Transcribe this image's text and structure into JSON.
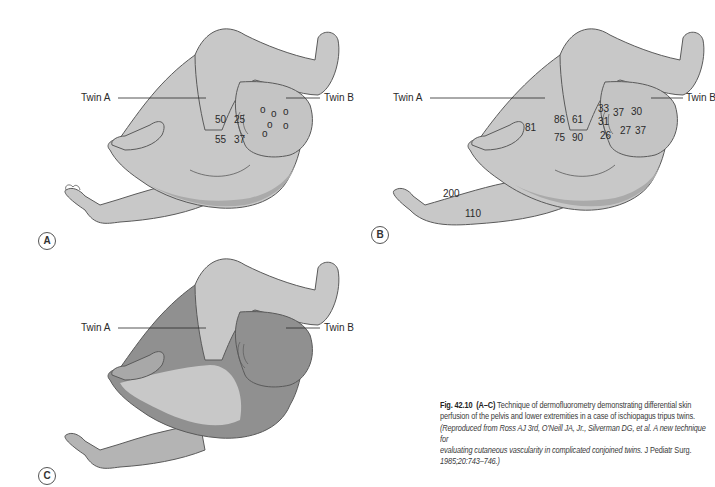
{
  "colors": {
    "body_light": "#c8c8c8",
    "body_mid": "#b4b4b4",
    "body_dark": "#8e8e8e",
    "outline": "#5a5a5a",
    "text": "#2a2a2a"
  },
  "panels": [
    {
      "badge": "A",
      "twin_a_label": "Twin A",
      "twin_b_label": "Twin B",
      "values_twin_a": [
        "50",
        "25",
        "55",
        "37"
      ],
      "twin_b_markers": [
        "o",
        "o",
        "o",
        "o",
        "o",
        "o"
      ]
    },
    {
      "badge": "B",
      "twin_a_label": "Twin A",
      "twin_b_label": "Twin B",
      "values_twin_a": [
        "81",
        "86",
        "61",
        "75",
        "90"
      ],
      "values_twin_b": [
        "33",
        "37",
        "30",
        "31",
        "26",
        "27",
        "37"
      ],
      "values_leg": [
        "200",
        "110"
      ]
    },
    {
      "badge": "C",
      "twin_a_label": "Twin A",
      "twin_b_label": "Twin B"
    }
  ],
  "caption": {
    "fig_label": "Fig. 42.10",
    "range_label": "(A–C)",
    "line1_rest": " Technique of dermofluorometry demonstrating differential skin",
    "line2": "perfusion of the pelvis and lower extremities in a case of ischiopagus tripus twins.",
    "line3_italic": "(Reproduced from Ross AJ 3rd, O'Neill JA, Jr., Silverman DG, et al. A new technique for",
    "line4_italic": "evaluating cutaneous vascularity in complicated conjoined twins.",
    "line4_journal": " J Pediatr Surg.",
    "line5_italic": "1985;20:743–746.)"
  }
}
